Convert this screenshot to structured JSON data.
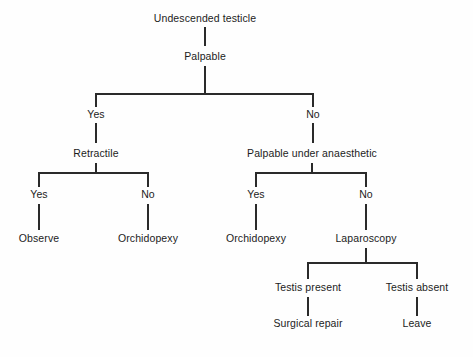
{
  "diagram": {
    "type": "decision-tree-flowchart",
    "background_color": "#fefefe",
    "line_color": "#2a2a2a",
    "text_color": "#1c1c1c",
    "nodes": [
      {
        "id": "n1",
        "label": "Undescended testicle",
        "x": 205,
        "y": 22,
        "kind": "root"
      },
      {
        "id": "n2",
        "label": "Palpable",
        "x": 205,
        "y": 60,
        "kind": "decision"
      },
      {
        "id": "n3",
        "label": "Yes",
        "x": 96,
        "y": 118,
        "kind": "answer"
      },
      {
        "id": "n4",
        "label": "No",
        "x": 313,
        "y": 118,
        "kind": "answer"
      },
      {
        "id": "n5",
        "label": "Retractile",
        "x": 96,
        "y": 157,
        "kind": "decision"
      },
      {
        "id": "n6",
        "label": "Palpable under anaesthetic",
        "x": 312,
        "y": 157,
        "kind": "decision"
      },
      {
        "id": "n7",
        "label": "Yes",
        "x": 39,
        "y": 198,
        "kind": "answer"
      },
      {
        "id": "n8",
        "label": "No",
        "x": 148,
        "y": 198,
        "kind": "answer"
      },
      {
        "id": "n9",
        "label": "Yes",
        "x": 256,
        "y": 198,
        "kind": "answer"
      },
      {
        "id": "n10",
        "label": "No",
        "x": 366,
        "y": 198,
        "kind": "answer"
      },
      {
        "id": "n11",
        "label": "Observe",
        "x": 39,
        "y": 242,
        "kind": "outcome"
      },
      {
        "id": "n12",
        "label": "Orchidopexy",
        "x": 148,
        "y": 242,
        "kind": "outcome"
      },
      {
        "id": "n13",
        "label": "Orchidopexy",
        "x": 256,
        "y": 242,
        "kind": "outcome"
      },
      {
        "id": "n14",
        "label": "Laparoscopy",
        "x": 366,
        "y": 242,
        "kind": "decision"
      },
      {
        "id": "n15",
        "label": "Testis present",
        "x": 308,
        "y": 291,
        "kind": "answer"
      },
      {
        "id": "n16",
        "label": "Testis absent",
        "x": 417,
        "y": 291,
        "kind": "answer"
      },
      {
        "id": "n17",
        "label": "Surgical repair",
        "x": 308,
        "y": 327,
        "kind": "outcome"
      },
      {
        "id": "n18",
        "label": "Leave",
        "x": 417,
        "y": 327,
        "kind": "outcome"
      }
    ],
    "edges": [
      {
        "from": "n1",
        "to": "n2",
        "kind": "straight",
        "points": "205,27 205,46"
      },
      {
        "from": "n2",
        "to": "n3",
        "kind": "split",
        "points": "205,66 205,94 96,94 96,107"
      },
      {
        "from": "n2",
        "to": "n4",
        "kind": "split",
        "points": "205,94 313,94 313,107"
      },
      {
        "from": "n3",
        "to": "n5",
        "kind": "straight",
        "points": "96,123 96,143"
      },
      {
        "from": "n4",
        "to": "n6",
        "kind": "straight",
        "points": "313,123 313,143"
      },
      {
        "from": "n5",
        "to": "n7",
        "kind": "split",
        "points": "96,163 96,173 39,173 39,187"
      },
      {
        "from": "n5",
        "to": "n8",
        "kind": "split",
        "points": "96,173 148,173 148,187"
      },
      {
        "from": "n6",
        "to": "n9",
        "kind": "split",
        "points": "312,163 312,173 256,173 256,187"
      },
      {
        "from": "n6",
        "to": "n10",
        "kind": "split",
        "points": "312,173 366,173 366,187"
      },
      {
        "from": "n7",
        "to": "n11",
        "kind": "straight",
        "points": "39,204 39,230"
      },
      {
        "from": "n8",
        "to": "n12",
        "kind": "straight",
        "points": "148,204 148,230"
      },
      {
        "from": "n9",
        "to": "n13",
        "kind": "straight",
        "points": "256,204 256,230"
      },
      {
        "from": "n10",
        "to": "n14",
        "kind": "straight",
        "points": "366,204 366,230"
      },
      {
        "from": "n14",
        "to": "n15",
        "kind": "split",
        "points": "366,248 366,263 308,263 308,279"
      },
      {
        "from": "n14",
        "to": "n16",
        "kind": "split",
        "points": "366,263 417,263 417,279"
      },
      {
        "from": "n15",
        "to": "n17",
        "kind": "straight",
        "points": "308,297 308,316"
      },
      {
        "from": "n16",
        "to": "n18",
        "kind": "straight",
        "points": "417,297 417,316"
      }
    ]
  }
}
